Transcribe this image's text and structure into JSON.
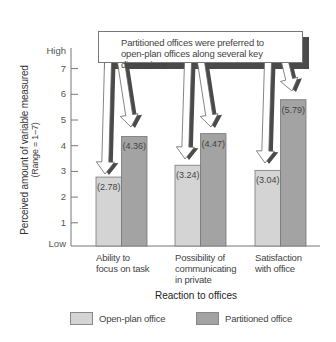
{
  "chart_data": {
    "type": "bar",
    "title": "",
    "callout": {
      "line1": "Partitioned offices were preferred to",
      "line2": "open-plan offices along several key dimensions"
    },
    "xlabel": "Reaction to offices",
    "ylabel": "Perceived amount of variable measured",
    "ylabel_sub": "(Range = 1–7)",
    "ylim": [
      1,
      7.5
    ],
    "yticks": [
      {
        "label": "High",
        "value": 7.7
      },
      {
        "label": "7",
        "value": 7
      },
      {
        "label": "6",
        "value": 6
      },
      {
        "label": "5",
        "value": 5
      },
      {
        "label": "4",
        "value": 4
      },
      {
        "label": "3",
        "value": 3
      },
      {
        "label": "2",
        "value": 2
      },
      {
        "label": "1",
        "value": 1
      },
      {
        "label": "Low",
        "value": 0.1
      }
    ],
    "categories": [
      "Ability to\nfocus on task",
      "Possibility of\ncommunicating\nin private",
      "Satisfaction\nwith office"
    ],
    "series": [
      {
        "name": "Open-plan office",
        "color": "#d4d4d4",
        "values": [
          2.78,
          3.24,
          3.04
        ],
        "labels": [
          "(2.78)",
          "(3.24)",
          "(3.04)"
        ]
      },
      {
        "name": "Partitioned office",
        "color": "#a3a3a3",
        "values": [
          4.36,
          4.47,
          5.79
        ],
        "labels": [
          "(4.36)",
          "(4.47)",
          "(5.79)"
        ]
      }
    ],
    "legend_position": "bottom",
    "grid": false
  }
}
